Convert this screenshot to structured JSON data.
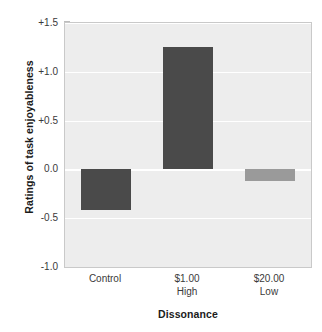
{
  "chart_data": {
    "type": "bar",
    "title": "",
    "xlabel": "Dissonance",
    "ylabel": "Ratings of task enjoyableness",
    "categories": [
      "Control",
      "$1.00 High",
      "$20.00 Low"
    ],
    "category_lines": [
      {
        "line1": "Control",
        "line2": ""
      },
      {
        "line1": "$1.00",
        "line2": "High"
      },
      {
        "line1": "$20.00",
        "line2": "Low"
      }
    ],
    "values": [
      -0.42,
      1.25,
      -0.12
    ],
    "ylim": [
      -1.0,
      1.5
    ],
    "yticks": [
      1.5,
      1.0,
      0.5,
      0.0,
      -0.5,
      -1.0
    ],
    "ytick_labels": [
      "+1.5",
      "+1.0",
      "+0.5",
      "0.0",
      "-0.5",
      "-1.0"
    ],
    "grid": true,
    "grid_color": "#ffffff",
    "legend": "none",
    "bar_colors": [
      "#4a4a4a",
      "#4a4a4a",
      "#9a9a9a"
    ],
    "plot_background": "#ededed",
    "figure_background": "#ffffff",
    "axis_color": "#c9c9c9"
  },
  "axes": {
    "y_title": "Ratings of task enjoyableness",
    "x_title": "Dissonance"
  }
}
